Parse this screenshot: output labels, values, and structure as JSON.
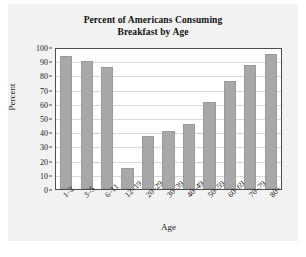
{
  "chart_data": {
    "type": "bar",
    "title": "Percent of Americans Consuming Breakfast by Age",
    "title_lines": [
      "Percent of Americans Consuming",
      "Breakfast by Age"
    ],
    "xlabel": "Age",
    "ylabel": "Percent",
    "categories": [
      "1–2",
      "3–5",
      "6–11",
      "12–19",
      "20–29",
      "30–39",
      "40–49",
      "50–59",
      "60–69",
      "70–79",
      "80+"
    ],
    "values": [
      94,
      90,
      86,
      15,
      37,
      41,
      46,
      61,
      76,
      87,
      95
    ],
    "ylim": [
      0,
      100
    ],
    "yticks": [
      0,
      10,
      20,
      30,
      40,
      50,
      60,
      70,
      80,
      90,
      100
    ],
    "ytick_labels": [
      "0",
      "10",
      "20",
      "30",
      "40",
      "50",
      "60",
      "70",
      "80",
      "90",
      "100"
    ],
    "grid": "horizontal",
    "legend": "none",
    "bar_color": "#a8a8a8",
    "plot_background": "#ffffff",
    "figure_background": "#f2f2f2",
    "axis_color": "#4d4d4d",
    "gridline_color": "#d9d9d9"
  }
}
